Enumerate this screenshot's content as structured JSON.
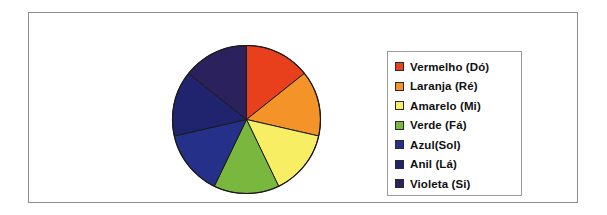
{
  "figure": {
    "frame_border_color": "#8d8d8d",
    "background_color": "#ffffff"
  },
  "legend": {
    "border_color": "#9a9a9a",
    "items": [
      {
        "label": "Vermelho (Dó)",
        "color": "#E8401C"
      },
      {
        "label": "Laranja (Ré)",
        "color": "#F39328"
      },
      {
        "label": "Amarelo (Mi)",
        "color": "#F7EE63"
      },
      {
        "label": "Verde (Fá)",
        "color": "#79B73E"
      },
      {
        "label": "Azul(Sol)",
        "color": "#253189"
      },
      {
        "label": "Anil (Lá)",
        "color": "#20246E"
      },
      {
        "label": "Violeta (Si)",
        "color": "#2B215C"
      }
    ]
  },
  "chart_data": {
    "type": "pie",
    "title": "",
    "subtitle": "",
    "xlabel": "",
    "ylabel": "",
    "grid": false,
    "legend_position": "right",
    "start_angle_deg": 0,
    "direction": "clockwise",
    "center_px": [
      75.5,
      75.5
    ],
    "radius_px": 74,
    "outline_color": "#1a1a1a",
    "labels": [
      "Vermelho (Dó)",
      "Laranja (Ré)",
      "Amarelo (Mi)",
      "Verde (Fá)",
      "Azul(Sol)",
      "Anil (Lá)",
      "Violeta (Si)"
    ],
    "values": [
      14.29,
      14.29,
      14.29,
      14.29,
      14.29,
      14.29,
      14.29
    ],
    "value_unit": "%",
    "slice_angle_deg": 51.43,
    "colors": [
      "#E8401C",
      "#F39328",
      "#F7EE63",
      "#79B73E",
      "#253189",
      "#20246E",
      "#2B215C"
    ]
  }
}
